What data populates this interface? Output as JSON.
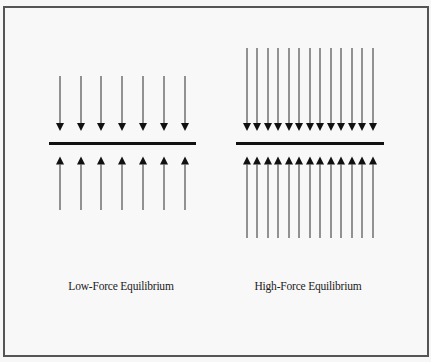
{
  "figure": {
    "panels": [
      {
        "id": "low-force",
        "label": "Low-Force Equilibrium",
        "arrow_count_per_side": 7,
        "arrow_x": [
          60,
          81,
          101,
          122,
          143,
          164,
          185
        ],
        "down_shaft_top": 76,
        "up_shaft_bottom": 210,
        "bar": {
          "x1": 49,
          "x2": 196,
          "y": 143.5
        },
        "label_center_x": 121
      },
      {
        "id": "high-force",
        "label": "High-Force Equilibrium",
        "arrow_count_per_side": 13,
        "arrow_x": [
          247,
          257,
          268,
          278,
          289,
          299,
          310,
          320,
          331,
          341,
          352,
          362,
          373
        ],
        "down_shaft_top": 48,
        "up_shaft_bottom": 238,
        "bar": {
          "x1": 236,
          "x2": 384,
          "y": 143.5
        },
        "label_center_x": 308
      }
    ],
    "arrowheads": {
      "down_base_y": 123,
      "down_tip_y": 131,
      "up_tip_y": 156.5,
      "up_base_y": 164.5,
      "half_width": 4
    },
    "colors": {
      "shaft": "#5a5a5a",
      "head": "#111111",
      "bar": "#111111",
      "frame": "#555555",
      "background": "#f8f8f8"
    }
  }
}
